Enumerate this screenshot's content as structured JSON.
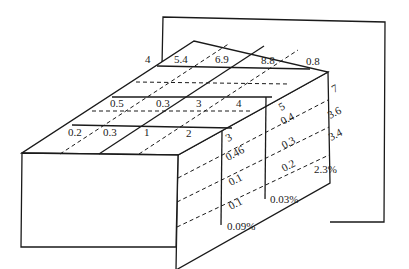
{
  "diagram": {
    "title": "",
    "back_panel_label": "4",
    "top_face": {
      "row_back": [
        "5.4",
        "6.9",
        "8.8",
        "0.8"
      ],
      "row_middle": [
        "0.5",
        "0.3",
        "3",
        "4"
      ],
      "row_front": [
        "0.2",
        "0.3",
        "1",
        "2"
      ]
    },
    "side_face": {
      "column_front": [
        "3",
        "0.46",
        "0.1",
        "0.1"
      ],
      "column_middle": [
        "5",
        "0.4",
        "0.3",
        "0.2"
      ],
      "column_back": [
        "7",
        "3.6",
        "3.4"
      ]
    },
    "percent_labels": {
      "front": "0.09%",
      "middle": "0.03%",
      "back": "2.3%"
    }
  }
}
